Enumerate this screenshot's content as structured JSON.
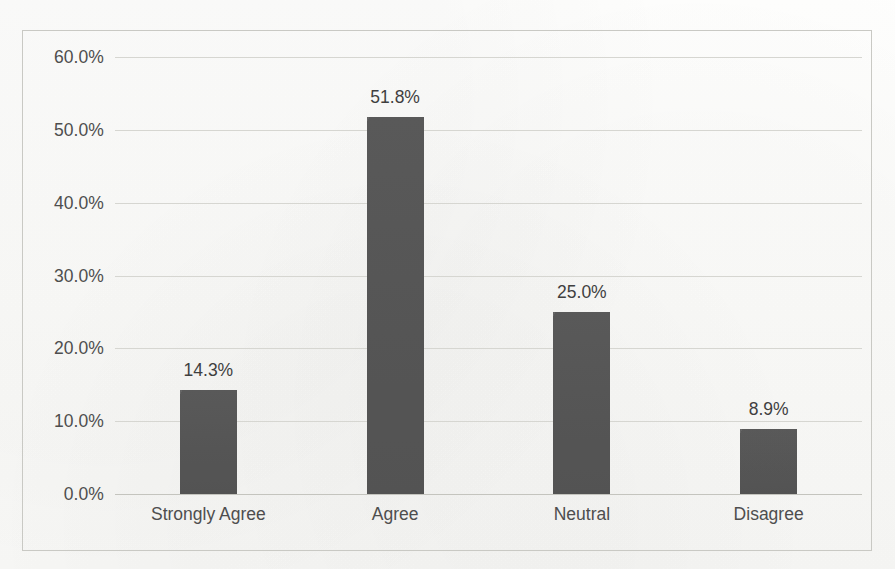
{
  "chart_data": {
    "type": "bar",
    "title": "",
    "subtitle": "",
    "xlabel": "",
    "ylabel": "",
    "categories": [
      "Strongly Agree",
      "Agree",
      "Neutral",
      "Disagree"
    ],
    "values": [
      14.3,
      51.8,
      25.0,
      8.9
    ],
    "data_labels": [
      "14.3%",
      "51.8%",
      "25.0%",
      "8.9%"
    ],
    "ylim": [
      0,
      60
    ],
    "ytick_values": [
      0,
      10,
      20,
      30,
      40,
      50,
      60
    ],
    "ytick_labels": [
      "0.0%",
      "10.0%",
      "20.0%",
      "30.0%",
      "40.0%",
      "50.0%",
      "60.0%"
    ],
    "grid": "horizontal",
    "legend": "none",
    "series": [
      {
        "name": "Response Percentage",
        "values": [
          14.3,
          51.8,
          25.0,
          8.9
        ]
      }
    ],
    "colors": {
      "bar": "#595959",
      "gridline": "#d6d6d1",
      "axis_text": "#4e4e4e",
      "data_label": "#3f3f3f",
      "frame_border": "#c9c9c4",
      "background": "#fdfdfb"
    }
  }
}
